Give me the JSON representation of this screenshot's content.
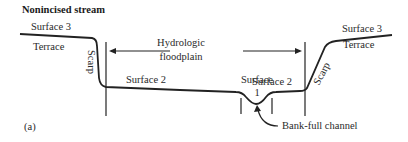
{
  "title": "Nonincised stream",
  "labels": {
    "surface3_left": "Surface 3",
    "terrace_left": "Terrace",
    "scarp_left": "Scarp",
    "floodplain_line1": "Hydrologic",
    "floodplain_line2": "floodplain",
    "surface2_left": "Surface 2",
    "surface1_line1": "Surface",
    "surface1_line2": "1",
    "surface2_right": "Surface 2",
    "surface3_right": "Surface 3",
    "terrace_right": "Terrace",
    "scarp_right": "Scarp",
    "bankfull": "Bank-full channel",
    "panel": "(a)"
  },
  "colors": {
    "line": "#222222",
    "background": "#ffffff"
  }
}
